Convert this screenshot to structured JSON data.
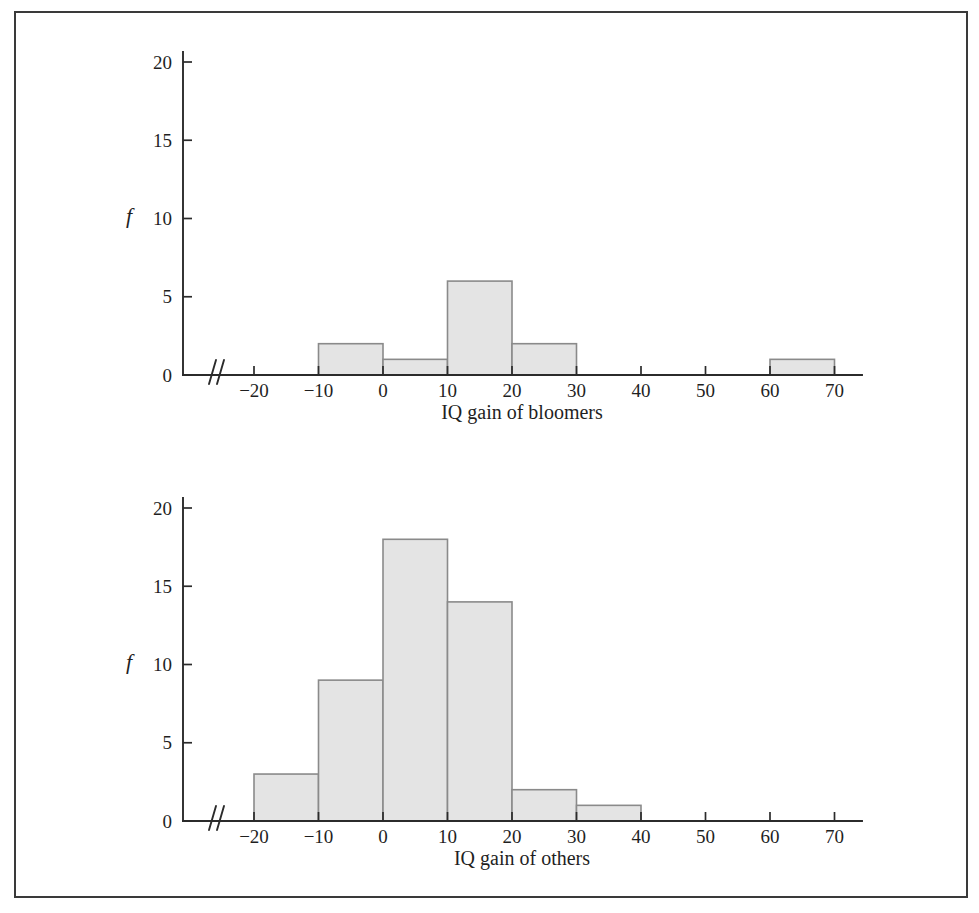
{
  "figure": {
    "frame_color": "#3a3a3a",
    "background": "#ffffff"
  },
  "style": {
    "bar_fill": "#e4e4e4",
    "bar_stroke": "#8a8a8a",
    "axis_color": "#2b2b2b",
    "text_color": "#1f1f1f"
  },
  "panels": [
    {
      "id": "bloomers",
      "y_axis_label": "f",
      "x_axis_title": "IQ gain of bloomers",
      "y_ticks": [
        "0",
        "5",
        "10",
        "15",
        "20"
      ],
      "x_ticks": [
        "−20",
        "−10",
        "0",
        "10",
        "20",
        "30",
        "40",
        "50",
        "60",
        "70"
      ],
      "axis_break_symbol": "⁄⁄"
    },
    {
      "id": "others",
      "y_axis_label": "f",
      "x_axis_title": "IQ gain of others",
      "y_ticks": [
        "0",
        "5",
        "10",
        "15",
        "20"
      ],
      "x_ticks": [
        "−20",
        "−10",
        "0",
        "10",
        "20",
        "30",
        "40",
        "50",
        "60",
        "70"
      ],
      "axis_break_symbol": "⁄⁄"
    }
  ],
  "chart_data": [
    {
      "type": "bar",
      "title": "",
      "subtitle": "",
      "xlabel": "IQ gain of bloomers",
      "ylabel": "f",
      "xlim": [
        -25,
        75
      ],
      "ylim": [
        0,
        20
      ],
      "yticks": [
        0,
        5,
        10,
        15,
        20
      ],
      "xticks": [
        -20,
        -10,
        0,
        10,
        20,
        30,
        40,
        50,
        60,
        70
      ],
      "grid": false,
      "legend": "none",
      "axis_break_on": "x",
      "bin_width": 10,
      "categories": [
        "-20 to -10",
        "-10 to 0",
        "0 to 10",
        "10 to 20",
        "20 to 30",
        "30 to 40",
        "40 to 50",
        "50 to 60",
        "60 to 70"
      ],
      "bin_edges": [
        -20,
        -10,
        0,
        10,
        20,
        30,
        40,
        50,
        60,
        70
      ],
      "values": [
        0,
        2,
        1,
        6,
        2,
        0,
        0,
        0,
        1
      ]
    },
    {
      "type": "bar",
      "title": "",
      "subtitle": "",
      "xlabel": "IQ gain of others",
      "ylabel": "f",
      "xlim": [
        -25,
        75
      ],
      "ylim": [
        0,
        20
      ],
      "yticks": [
        0,
        5,
        10,
        15,
        20
      ],
      "xticks": [
        -20,
        -10,
        0,
        10,
        20,
        30,
        40,
        50,
        60,
        70
      ],
      "grid": false,
      "legend": "none",
      "axis_break_on": "x",
      "bin_width": 10,
      "categories": [
        "-20 to -10",
        "-10 to 0",
        "0 to 10",
        "10 to 20",
        "20 to 30",
        "30 to 40",
        "40 to 50",
        "50 to 60",
        "60 to 70"
      ],
      "bin_edges": [
        -20,
        -10,
        0,
        10,
        20,
        30,
        40,
        50,
        60,
        70
      ],
      "values": [
        3,
        9,
        18,
        14,
        2,
        1,
        0,
        0,
        0
      ]
    }
  ]
}
